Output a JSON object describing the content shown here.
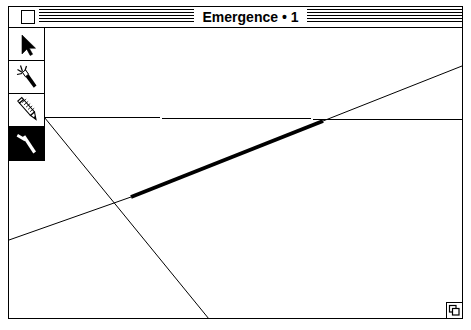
{
  "window": {
    "title": "Emergence • 1",
    "close_box_label": "close",
    "grow_box_label": "resize",
    "title_bar_pattern": "horizontal-stripes",
    "colors": {
      "frame": "#000000",
      "canvas_background": "#ffffff",
      "ink": "#000000",
      "selected_tool_background": "#000000",
      "selected_tool_ink": "#ffffff"
    }
  },
  "palette": {
    "label": "Tools",
    "tools": [
      {
        "name": "arrow-tool",
        "label": "Arrow",
        "icon": "arrow-pointer-icon",
        "selected": false
      },
      {
        "name": "magic-wand-tool",
        "label": "Magic Wand",
        "icon": "magic-wand-icon",
        "selected": false
      },
      {
        "name": "pencil-tool",
        "label": "Pencil",
        "icon": "pencil-icon",
        "selected": false
      },
      {
        "name": "line-tool",
        "label": "Line",
        "icon": "line-tool-icon",
        "selected": true
      }
    ]
  },
  "canvas": {
    "label": "Drawing canvas",
    "shapes": [
      {
        "name": "horizontal-line",
        "type": "line",
        "x1": 0,
        "y1": 89,
        "x2": 453,
        "y2": 92,
        "thickness": 1,
        "selected": false
      },
      {
        "name": "descending-diagonal-line",
        "type": "line",
        "x1": 0,
        "y1": 46,
        "x2": 200,
        "y2": 291,
        "thickness": 1,
        "selected": false
      },
      {
        "name": "ascending-line-left-segment",
        "type": "line",
        "x1": 0,
        "y1": 212,
        "x2": 122,
        "y2": 169,
        "thickness": 1,
        "selected": false
      },
      {
        "name": "ascending-line-selected-segment",
        "type": "line",
        "x1": 122,
        "y1": 169,
        "x2": 314,
        "y2": 93,
        "thickness": 4,
        "selected": true
      },
      {
        "name": "ascending-line-right-segment",
        "type": "line",
        "x1": 314,
        "y1": 93,
        "x2": 453,
        "y2": 38,
        "thickness": 1,
        "selected": false
      }
    ]
  }
}
